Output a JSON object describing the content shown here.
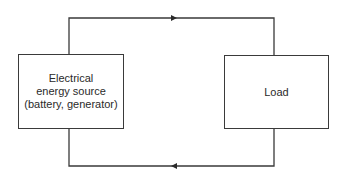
{
  "diagram": {
    "type": "circuit-block-diagram",
    "nodes": [
      {
        "id": "source",
        "label_lines": [
          "Electrical",
          "energy source",
          "(battery, generator)"
        ]
      },
      {
        "id": "load",
        "label_lines": [
          "Load"
        ]
      }
    ],
    "edges": [
      {
        "from": "source",
        "to": "load",
        "path": "top",
        "arrow_direction": "right"
      },
      {
        "from": "load",
        "to": "source",
        "path": "bottom",
        "arrow_direction": "left"
      }
    ],
    "colors": {
      "line": "#3a3a3a",
      "text": "#2a2a2a",
      "background": "#ffffff"
    }
  }
}
